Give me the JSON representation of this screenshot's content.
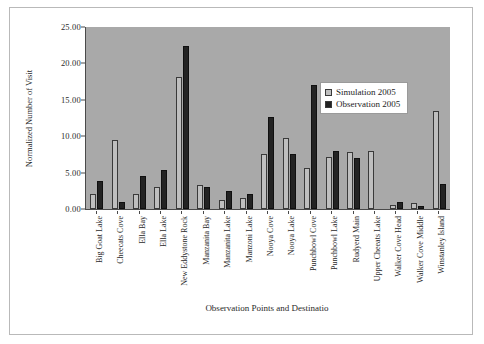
{
  "chart_data": {
    "type": "bar",
    "title": "",
    "xlabel": "Observation Points and Destinatio",
    "ylabel": "Normalized Number of Visit",
    "ylim": [
      0,
      25
    ],
    "ytick_values": [
      0,
      5,
      10,
      15,
      20,
      25
    ],
    "ytick_labels": [
      "0.00",
      "5.00",
      "10.00",
      "15.00",
      "20.00",
      "25.00"
    ],
    "grid": false,
    "legend_position": "upper-right-inside",
    "plot_background": "#a9a9a9",
    "categories": [
      "Big Goat Lake",
      "Cheecats Cove",
      "Ella Bay",
      "Ella Lake",
      "New Eddystone Rock",
      "Manzanita Bay",
      "Manzanita Lake",
      "Manzoni Lake",
      "Nooya Cove",
      "Nooya Lake",
      "Punchbowl Cove",
      "Punchbowl Lake",
      "Rudyerd Main",
      "Upper Cheeats Lake",
      "Walker Cove Head",
      "Walker Cove Middle",
      "Winstanley Island"
    ],
    "series": [
      {
        "name": "Simulation 2005",
        "color": "#bfbfbf",
        "values": [
          2.1,
          9.5,
          2.0,
          3.0,
          18.2,
          3.3,
          1.2,
          1.5,
          7.5,
          9.7,
          5.6,
          7.2,
          7.8,
          8.0,
          0.5,
          0.8,
          13.5
        ]
      },
      {
        "name": "Observation 2005",
        "color": "#232323",
        "values": [
          3.9,
          1.0,
          4.5,
          5.4,
          22.4,
          3.0,
          2.5,
          2.0,
          12.7,
          7.5,
          17.0,
          8.0,
          7.0,
          0.0,
          1.0,
          0.4,
          3.5
        ]
      }
    ]
  },
  "legend": {
    "items": [
      {
        "label": "Simulation 2005"
      },
      {
        "label": "Observation 2005"
      }
    ]
  }
}
